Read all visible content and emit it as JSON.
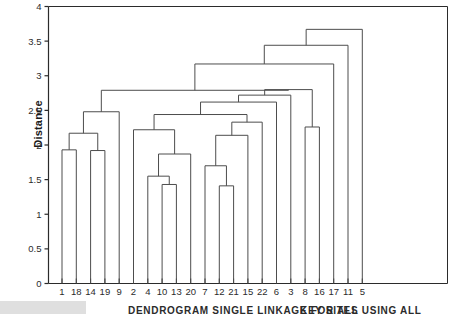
{
  "figure": {
    "y_axis_title": "Distance",
    "caption_line_1": "DENDROGRAM  SINGLE LINKAGE FOR ALL",
    "caption_line_2": "KEY SITES USING ALL",
    "line_color": "#4d4d4d",
    "axis_color": "#2b2b2b",
    "background": "#ffffff"
  },
  "chart_data": {
    "type": "dendrogram",
    "title": "",
    "subtitle": "",
    "xlabel": "",
    "ylabel": "Distance",
    "ylim": [
      0,
      4
    ],
    "yticks": [
      0,
      0.5,
      1,
      1.5,
      2,
      2.5,
      3,
      3.5,
      4
    ],
    "ytick_labels": [
      "0",
      "0.5",
      "1",
      "1.5",
      "2",
      "2.5",
      "3",
      "3.5",
      "4"
    ],
    "grid": false,
    "legend": null,
    "orientation": "vertical",
    "linkage": "single",
    "leaf_order": [
      "1",
      "18",
      "14",
      "19",
      "9",
      "2",
      "4",
      "10",
      "13",
      "20",
      "7",
      "12",
      "21",
      "15",
      "22",
      "6",
      "3",
      "8",
      "16",
      "17",
      "11",
      "5"
    ],
    "leaf_count": 22,
    "merges": [
      {
        "id": "m1",
        "left": "1",
        "right": "18",
        "height": 1.93
      },
      {
        "id": "m2",
        "left": "14",
        "right": "19",
        "height": 1.92
      },
      {
        "id": "m3",
        "left": "m1",
        "right": "m2",
        "height": 2.17
      },
      {
        "id": "m4",
        "left": "10",
        "right": "13",
        "height": 1.43
      },
      {
        "id": "m5",
        "left": "4",
        "right": "m4",
        "height": 1.55
      },
      {
        "id": "m6",
        "left": "m5",
        "right": "20",
        "height": 1.87
      },
      {
        "id": "m7",
        "left": "2",
        "right": "m6",
        "height": 2.22
      },
      {
        "id": "m8",
        "left": "12",
        "right": "21",
        "height": 1.41
      },
      {
        "id": "m9",
        "left": "7",
        "right": "m8",
        "height": 1.7
      },
      {
        "id": "m10",
        "left": "m9",
        "right": "15",
        "height": 2.14
      },
      {
        "id": "m11",
        "left": "m10",
        "right": "22",
        "height": 2.33
      },
      {
        "id": "m12",
        "left": "m7",
        "right": "m11",
        "height": 2.44
      },
      {
        "id": "m13",
        "left": "m3",
        "right": "9",
        "height": 2.48
      },
      {
        "id": "m14",
        "left": "8",
        "right": "16",
        "height": 2.26
      },
      {
        "id": "m15",
        "left": "m12",
        "right": "6",
        "height": 2.62
      },
      {
        "id": "m16",
        "left": "m15",
        "right": "3",
        "height": 2.72
      },
      {
        "id": "m17",
        "left": "m16",
        "right": "m14",
        "height": 2.8
      },
      {
        "id": "m18",
        "left": "m13",
        "right": "m17",
        "height": 2.79
      },
      {
        "id": "m19",
        "left": "m18",
        "right": "17",
        "height": 3.17
      },
      {
        "id": "m20",
        "left": "m19",
        "right": "11",
        "height": 3.44
      },
      {
        "id": "m21",
        "left": "m20",
        "right": "5",
        "height": 3.67
      }
    ]
  }
}
